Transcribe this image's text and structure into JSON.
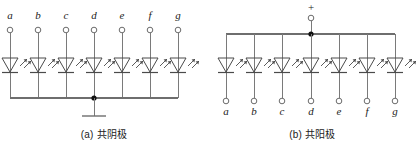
{
  "figure": {
    "line_color": "#7a7a7a",
    "symbol_color": "#4a4a4a",
    "junction_color": "#101010",
    "background": "#ffffff"
  },
  "panels": [
    {
      "id": "a",
      "caption": "(a) 共阴极",
      "caption_prefix": "(a)",
      "caption_cn": "共阴极",
      "common_terminal": "ground",
      "common_terminal_symbol": "earth-ground",
      "pin_label_position": "top",
      "pins": [
        {
          "label": "a",
          "x": 10
        },
        {
          "label": "b",
          "x": 38
        },
        {
          "label": "c",
          "x": 66
        },
        {
          "label": "d",
          "x": 94
        },
        {
          "label": "e",
          "x": 122
        },
        {
          "label": "f",
          "x": 150
        },
        {
          "label": "g",
          "x": 178
        }
      ],
      "bus_y": 98,
      "terminal_y": 29,
      "diode_y": 66,
      "junction_x": 94
    },
    {
      "id": "b",
      "caption": "(b) 共阳极",
      "caption_prefix": "(b)",
      "caption_cn": "共阳极",
      "common_terminal": "positive-supply",
      "common_terminal_symbol": "plus",
      "plus_sign": "+",
      "pin_label_position": "bottom",
      "pins": [
        {
          "label": "a",
          "x": 226
        },
        {
          "label": "b",
          "x": 254
        },
        {
          "label": "c",
          "x": 282
        },
        {
          "label": "d",
          "x": 311
        },
        {
          "label": "e",
          "x": 339
        },
        {
          "label": "f",
          "x": 367
        },
        {
          "label": "g",
          "x": 395
        }
      ],
      "bus_y": 34,
      "terminal_y": 101,
      "diode_y": 66,
      "junction_x": 311,
      "supply_terminal_y": 14
    }
  ],
  "symbols": {
    "led": "light-emitting-diode",
    "terminal": "open-circle-terminal",
    "junction": "wire-junction-dot",
    "ground": "earth-ground-symbol"
  }
}
